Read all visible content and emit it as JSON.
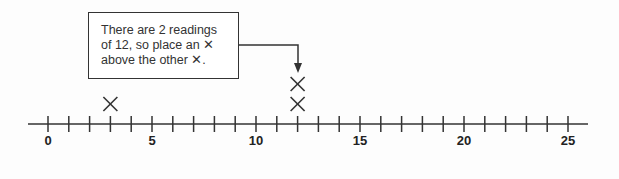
{
  "callout": {
    "lines": [
      "There are 2 readings",
      "of 12, so place an ✕",
      "above the other ✕."
    ]
  },
  "chart_data": {
    "type": "dot_plot",
    "title": "",
    "axis": {
      "min": 0,
      "max": 25,
      "tick_step": 1,
      "labeled_ticks": [
        0,
        5,
        10,
        15,
        20,
        25
      ]
    },
    "points": [
      {
        "value": 3,
        "count": 1
      },
      {
        "value": 12,
        "count": 2
      }
    ],
    "annotation": "There are 2 readings of 12, so place an X above the other X.",
    "marker": "X"
  },
  "tick_labels": [
    "0",
    "5",
    "10",
    "15",
    "20",
    "25"
  ]
}
